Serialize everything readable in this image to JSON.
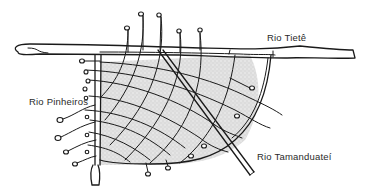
{
  "diagram": {
    "type": "hand-drawn river map sketch",
    "colors": {
      "ink": "#1a1a1a",
      "shading": "#c8c8c8",
      "background": "#ffffff",
      "label_text": "#2a2a2a"
    },
    "labels": {
      "tiete": "Rio Tietê",
      "pinheiros": "Rio Pinheiros",
      "tamanduatei": "Rio Tamanduateí"
    },
    "rivers": [
      {
        "name": "Rio Tietê",
        "orientation": "horizontal",
        "position": "top"
      },
      {
        "name": "Rio Pinheiros",
        "orientation": "vertical",
        "position": "left"
      },
      {
        "name": "Rio Tamanduateí",
        "orientation": "diagonal",
        "position": "right"
      }
    ],
    "grid": {
      "description": "curved mesh of streams between rivers, shaded area",
      "top_terminals": 5,
      "left_terminals": 9,
      "right_terminals": 4,
      "bottom_terminals": 2
    }
  }
}
